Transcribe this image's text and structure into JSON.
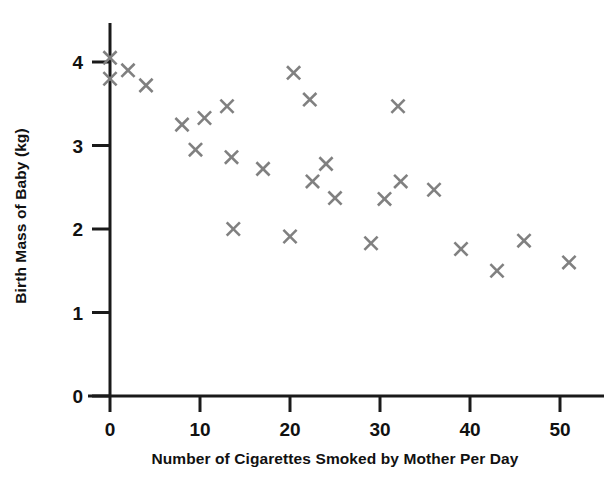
{
  "chart_data": {
    "type": "scatter",
    "title": "",
    "xlabel": "Number of Cigarettes Smoked by Mother Per Day",
    "ylabel": "Birth Mass of Baby (kg)",
    "xlim": [
      0,
      54
    ],
    "ylim": [
      0,
      4.3
    ],
    "xticks": [
      0,
      10,
      20,
      30,
      40,
      50
    ],
    "yticks": [
      0,
      1,
      2,
      3,
      4
    ],
    "xtick_labels": [
      "0",
      "10",
      "20",
      "30",
      "40",
      "50"
    ],
    "ytick_labels": [
      "0",
      "1",
      "2",
      "3",
      "4"
    ],
    "grid": false,
    "legend": "none",
    "marker": "x",
    "marker_color": "#808080",
    "axis_color": "#1a1a1a",
    "points": [
      {
        "x": 0,
        "y": 4.05
      },
      {
        "x": 0,
        "y": 3.8
      },
      {
        "x": 2,
        "y": 3.9
      },
      {
        "x": 4,
        "y": 3.72
      },
      {
        "x": 8,
        "y": 3.25
      },
      {
        "x": 9.5,
        "y": 2.95
      },
      {
        "x": 10.5,
        "y": 3.33
      },
      {
        "x": 13,
        "y": 3.47
      },
      {
        "x": 13.5,
        "y": 2.86
      },
      {
        "x": 13.7,
        "y": 2.0
      },
      {
        "x": 17,
        "y": 2.72
      },
      {
        "x": 20,
        "y": 1.91
      },
      {
        "x": 20.4,
        "y": 3.87
      },
      {
        "x": 22.2,
        "y": 3.55
      },
      {
        "x": 22.5,
        "y": 2.57
      },
      {
        "x": 24,
        "y": 2.78
      },
      {
        "x": 25,
        "y": 2.37
      },
      {
        "x": 29,
        "y": 1.83
      },
      {
        "x": 30.5,
        "y": 2.36
      },
      {
        "x": 32,
        "y": 3.47
      },
      {
        "x": 32.3,
        "y": 2.57
      },
      {
        "x": 36,
        "y": 2.47
      },
      {
        "x": 39,
        "y": 1.76
      },
      {
        "x": 43,
        "y": 1.5
      },
      {
        "x": 46,
        "y": 1.86
      },
      {
        "x": 51,
        "y": 1.6
      }
    ]
  }
}
